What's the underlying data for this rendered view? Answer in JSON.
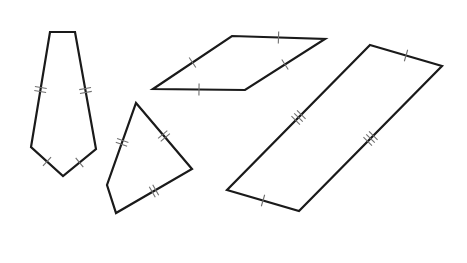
{
  "figure": {
    "width": 467,
    "height": 263,
    "background": "#ffffff",
    "stroke_color": "#1a1a1a",
    "tick_color": "#707070",
    "shapes": [
      {
        "name": "kite",
        "points": [
          [
            50,
            32
          ],
          [
            75,
            32
          ],
          [
            96,
            149
          ],
          [
            63,
            176
          ],
          [
            31,
            147
          ]
        ],
        "ticks": [
          {
            "edge": [
              [
                50,
                32
              ],
              [
                31,
                147
              ]
            ],
            "t": 0.5,
            "count": 2
          },
          {
            "edge": [
              [
                75,
                32
              ],
              [
                96,
                149
              ]
            ],
            "t": 0.5,
            "count": 2
          },
          {
            "edge": [
              [
                31,
                147
              ],
              [
                63,
                176
              ]
            ],
            "t": 0.5,
            "count": 1
          },
          {
            "edge": [
              [
                96,
                149
              ],
              [
                63,
                176
              ]
            ],
            "t": 0.5,
            "count": 1
          }
        ]
      },
      {
        "name": "quadrilateral-double-ticks",
        "points": [
          [
            136,
            103
          ],
          [
            192,
            169
          ],
          [
            116,
            213
          ],
          [
            107,
            185
          ]
        ],
        "ticks": [
          {
            "edge": [
              [
                136,
                103
              ],
              [
                107,
                185
              ]
            ],
            "t": 0.48,
            "count": 2
          },
          {
            "edge": [
              [
                136,
                103
              ],
              [
                192,
                169
              ]
            ],
            "t": 0.5,
            "count": 2
          },
          {
            "edge": [
              [
                192,
                169
              ],
              [
                116,
                213
              ]
            ],
            "t": 0.5,
            "count": 2
          }
        ]
      },
      {
        "name": "rhombus",
        "points": [
          [
            153,
            89
          ],
          [
            232,
            36
          ],
          [
            325,
            39
          ],
          [
            245,
            90
          ]
        ],
        "ticks": [
          {
            "edge": [
              [
                153,
                89
              ],
              [
                232,
                36
              ]
            ],
            "t": 0.5,
            "count": 1
          },
          {
            "edge": [
              [
                232,
                36
              ],
              [
                325,
                39
              ]
            ],
            "t": 0.5,
            "count": 1
          },
          {
            "edge": [
              [
                325,
                39
              ],
              [
                245,
                90
              ]
            ],
            "t": 0.5,
            "count": 1
          },
          {
            "edge": [
              [
                245,
                90
              ],
              [
                153,
                89
              ]
            ],
            "t": 0.5,
            "count": 1
          }
        ]
      },
      {
        "name": "parallelogram",
        "points": [
          [
            370,
            45
          ],
          [
            442,
            66
          ],
          [
            299,
            211
          ],
          [
            227,
            190
          ]
        ],
        "ticks": [
          {
            "edge": [
              [
                370,
                45
              ],
              [
                442,
                66
              ]
            ],
            "t": 0.5,
            "count": 1
          },
          {
            "edge": [
              [
                227,
                190
              ],
              [
                299,
                211
              ]
            ],
            "t": 0.5,
            "count": 1
          },
          {
            "edge": [
              [
                370,
                45
              ],
              [
                227,
                190
              ]
            ],
            "t": 0.5,
            "count": 3
          },
          {
            "edge": [
              [
                442,
                66
              ],
              [
                299,
                211
              ]
            ],
            "t": 0.5,
            "count": 3
          }
        ]
      }
    ]
  }
}
